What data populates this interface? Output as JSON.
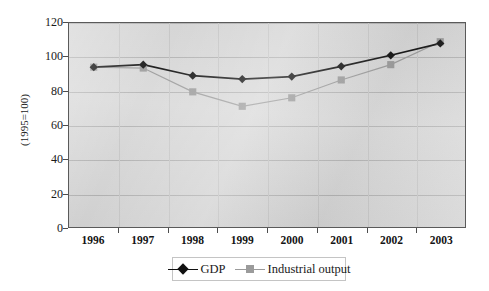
{
  "chart_data": {
    "type": "line",
    "title": "",
    "xlabel": "",
    "ylabel": "(1995=100)",
    "categories": [
      "1996",
      "1997",
      "1998",
      "1999",
      "2000",
      "2001",
      "2002",
      "2003"
    ],
    "series": [
      {
        "name": "GDP",
        "marker": "diamond",
        "color": "#111111",
        "values": [
          94,
          95.5,
          89,
          87,
          88.5,
          94.5,
          101,
          108
        ]
      },
      {
        "name": "Industrial output",
        "marker": "square",
        "color": "#9b9b9b",
        "values": [
          94,
          93.5,
          79.5,
          71,
          76,
          86.5,
          95.5,
          109
        ]
      }
    ],
    "ylim": [
      0,
      120
    ],
    "ytick_values": [
      0,
      20,
      40,
      60,
      80,
      100,
      120
    ],
    "ytick_labels": [
      "0",
      "20",
      "40",
      "60",
      "80",
      "100",
      "120"
    ],
    "grid": "horizontal",
    "legend_position": "bottom",
    "plot_background": "#d8d8d8",
    "plot_border_color": "#5a5a5a",
    "gridline_color": "#b3b3b3"
  },
  "legend": {
    "items": [
      {
        "label": "GDP"
      },
      {
        "label": "Industrial output"
      }
    ]
  }
}
